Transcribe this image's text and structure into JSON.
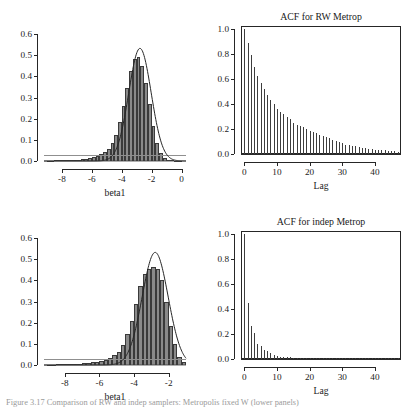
{
  "figure": {
    "caption": "Figure  3.17   Comparison of RW and indep samplers: Metropolis fixed W (lower panels)"
  },
  "chart_data": [
    {
      "id": "hist-rw",
      "type": "bar",
      "title": "",
      "xlabel": "beta1",
      "ylabel": "",
      "xlim": [
        -9.2,
        0.3
      ],
      "ylim": [
        0.0,
        0.62
      ],
      "xticks": [
        -8,
        -6,
        -4,
        -2,
        0
      ],
      "xticklabels": [
        "-8",
        "-6",
        "-4",
        "-2",
        "0"
      ],
      "yticks": [
        0.0,
        0.1,
        0.2,
        0.3,
        0.4,
        0.5,
        0.6
      ],
      "yticklabels": [
        "0.0",
        "0.1",
        "0.2",
        "0.3",
        "0.4",
        "0.5",
        "0.6"
      ],
      "grid": false,
      "bin_width": 0.25,
      "bin_left_edges": [
        -9.0,
        -8.75,
        -8.5,
        -8.25,
        -8.0,
        -7.75,
        -7.5,
        -7.25,
        -7.0,
        -6.75,
        -6.5,
        -6.25,
        -6.0,
        -5.75,
        -5.5,
        -5.25,
        -5.0,
        -4.75,
        -4.5,
        -4.25,
        -4.0,
        -3.75,
        -3.5,
        -3.25,
        -3.0,
        -2.75,
        -2.5,
        -2.25,
        -2.0,
        -1.75,
        -1.5,
        -1.25,
        -1.0,
        -0.75,
        -0.5,
        -0.25
      ],
      "values": [
        0.002,
        0.002,
        0.003,
        0.003,
        0.004,
        0.004,
        0.005,
        0.006,
        0.007,
        0.009,
        0.011,
        0.014,
        0.018,
        0.024,
        0.032,
        0.043,
        0.058,
        0.085,
        0.125,
        0.185,
        0.26,
        0.345,
        0.425,
        0.485,
        0.49,
        0.45,
        0.37,
        0.27,
        0.165,
        0.085,
        0.036,
        0.013,
        0.005,
        0.003,
        0.002,
        0.002
      ],
      "overlay_curve": {
        "name": "normal-density",
        "mean": -2.78,
        "sd": 0.75,
        "peak": 0.533,
        "color": "#262626"
      },
      "baseline_curve": {
        "name": "prior-density",
        "level": 0.03,
        "color": "#8f8f8f"
      }
    },
    {
      "id": "acf-rw",
      "type": "bar",
      "title": "ACF for RW Metrop",
      "xlabel": "Lag",
      "ylabel": "",
      "xlim": [
        -1,
        48
      ],
      "ylim": [
        0.0,
        1.02
      ],
      "xticks": [
        0,
        10,
        20,
        30,
        40
      ],
      "xticklabels": [
        "0",
        "10",
        "20",
        "30",
        "40"
      ],
      "yticks": [
        0.0,
        0.2,
        0.4,
        0.6,
        0.8,
        1.0
      ],
      "yticklabels": [
        "0.0",
        "0.2",
        "0.4",
        "0.6",
        "0.8",
        "1.0"
      ],
      "grid": false,
      "lags": [
        0,
        1,
        2,
        3,
        4,
        5,
        6,
        7,
        8,
        9,
        10,
        11,
        12,
        13,
        14,
        15,
        16,
        17,
        18,
        19,
        20,
        21,
        22,
        23,
        24,
        25,
        26,
        27,
        28,
        29,
        30,
        31,
        32,
        33,
        34,
        35,
        36,
        37,
        38,
        39,
        40,
        41,
        42,
        43,
        44,
        45,
        46,
        47
      ],
      "values": [
        1.0,
        0.885,
        0.79,
        0.695,
        0.625,
        0.565,
        0.515,
        0.47,
        0.43,
        0.4,
        0.36,
        0.335,
        0.315,
        0.295,
        0.275,
        0.25,
        0.235,
        0.225,
        0.215,
        0.2,
        0.185,
        0.175,
        0.165,
        0.155,
        0.145,
        0.135,
        0.125,
        0.115,
        0.105,
        0.095,
        0.085,
        0.075,
        0.07,
        0.065,
        0.06,
        0.055,
        0.05,
        0.045,
        0.04,
        0.038,
        0.035,
        0.032,
        0.03,
        0.028,
        0.025,
        0.022,
        0.02,
        0.018
      ]
    },
    {
      "id": "hist-indep",
      "type": "bar",
      "title": "",
      "xlabel": "beta1",
      "ylabel": "",
      "xlim": [
        -9.2,
        -1.0
      ],
      "ylim": [
        0.0,
        0.62
      ],
      "xticks": [
        -8,
        -6,
        -4,
        -2
      ],
      "xticklabels": [
        "-8",
        "-6",
        "-4",
        "-2"
      ],
      "yticks": [
        0.0,
        0.1,
        0.2,
        0.3,
        0.4,
        0.5,
        0.6
      ],
      "yticklabels": [
        "0.0",
        "0.1",
        "0.2",
        "0.3",
        "0.4",
        "0.5",
        "0.6"
      ],
      "grid": false,
      "bin_width": 0.25,
      "bin_left_edges": [
        -9.0,
        -8.75,
        -8.5,
        -8.25,
        -8.0,
        -7.75,
        -7.5,
        -7.25,
        -7.0,
        -6.75,
        -6.5,
        -6.25,
        -6.0,
        -5.75,
        -5.5,
        -5.25,
        -5.0,
        -4.75,
        -4.5,
        -4.25,
        -4.0,
        -3.75,
        -3.5,
        -3.25,
        -3.0,
        -2.75,
        -2.5,
        -2.25,
        -2.0,
        -1.75,
        -1.5,
        -1.25
      ],
      "values": [
        0.002,
        0.002,
        0.003,
        0.003,
        0.004,
        0.004,
        0.005,
        0.006,
        0.008,
        0.01,
        0.013,
        0.016,
        0.02,
        0.026,
        0.034,
        0.046,
        0.062,
        0.095,
        0.145,
        0.21,
        0.29,
        0.375,
        0.43,
        0.455,
        0.465,
        0.455,
        0.4,
        0.3,
        0.185,
        0.1,
        0.04,
        0.012
      ],
      "overlay_curve": {
        "name": "normal-density",
        "mean": -2.78,
        "sd": 0.75,
        "peak": 0.533,
        "color": "#262626"
      },
      "baseline_curve": {
        "name": "prior-density",
        "level": 0.03,
        "color": "#8f8f8f"
      }
    },
    {
      "id": "acf-indep",
      "type": "bar",
      "title": "ACF for indep Metrop",
      "xlabel": "Lag",
      "ylabel": "",
      "xlim": [
        -1,
        48
      ],
      "ylim": [
        0.0,
        1.02
      ],
      "xticks": [
        0,
        10,
        20,
        30,
        40
      ],
      "xticklabels": [
        "0",
        "10",
        "20",
        "30",
        "40"
      ],
      "yticks": [
        0.0,
        0.2,
        0.4,
        0.6,
        0.8,
        1.0
      ],
      "yticklabels": [
        "0.0",
        "0.2",
        "0.4",
        "0.6",
        "0.8",
        "1.0"
      ],
      "grid": false,
      "lags": [
        0,
        1,
        2,
        3,
        4,
        5,
        6,
        7,
        8,
        9,
        10,
        11,
        12,
        13,
        14,
        15,
        16,
        17,
        18,
        19,
        20,
        21,
        22,
        23,
        24,
        25,
        26,
        27,
        28,
        29,
        30,
        31,
        32,
        33,
        34,
        35,
        36,
        37,
        38,
        39,
        40,
        41,
        42,
        43,
        44,
        45,
        46,
        47
      ],
      "values": [
        1.0,
        0.445,
        0.265,
        0.205,
        0.12,
        0.105,
        0.075,
        0.06,
        0.045,
        0.03,
        0.022,
        0.018,
        0.015,
        0.013,
        0.012,
        0.011,
        0.01,
        0.01,
        0.01,
        0.01,
        0.01,
        0.01,
        0.01,
        0.01,
        0.01,
        0.01,
        0.01,
        0.01,
        0.01,
        0.01,
        0.01,
        0.01,
        0.01,
        0.01,
        0.01,
        0.01,
        0.01,
        0.01,
        0.01,
        0.01,
        0.01,
        0.01,
        0.01,
        0.01,
        0.01,
        0.01,
        0.01,
        0.01
      ]
    }
  ]
}
